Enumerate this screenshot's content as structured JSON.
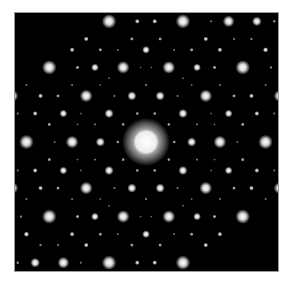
{
  "image": {
    "description": "Electron diffraction pattern with ten-fold (decagonal) quasicrystalline symmetry",
    "background_color": "#ffffff",
    "frame": {
      "x": 15,
      "y": 13,
      "width": 263,
      "height": 258,
      "color": "#000000",
      "edge_color": "#9a9a9a"
    },
    "spot_color": "#ffffff"
  },
  "pattern": {
    "symmetry_order": 10,
    "center": {
      "x": 146,
      "y": 142
    },
    "basis_length_px": 17.8,
    "stretch": {
      "x": 0.98,
      "y": 1.04
    },
    "rotation_deg": 0,
    "index_range": 5,
    "perp_sigma": 0.36,
    "min_intensity": 0.06,
    "central_beam": {
      "radius": 13,
      "glow_radius": 24
    },
    "spot_radius": {
      "min": 0.7,
      "max": 3.6
    },
    "glow_threshold": 0.45
  },
  "observed_bright_spots": [
    {
      "x": 146,
      "y": 48
    },
    {
      "x": 89,
      "y": 66
    },
    {
      "x": 203,
      "y": 66
    },
    {
      "x": 54,
      "y": 113
    },
    {
      "x": 239,
      "y": 113
    },
    {
      "x": 54,
      "y": 172
    },
    {
      "x": 239,
      "y": 172
    },
    {
      "x": 89,
      "y": 218
    },
    {
      "x": 204,
      "y": 218
    },
    {
      "x": 146,
      "y": 236
    }
  ],
  "observed_medium_spots": [
    {
      "x": 111,
      "y": 37
    },
    {
      "x": 182,
      "y": 37
    },
    {
      "x": 54,
      "y": 77
    },
    {
      "x": 239,
      "y": 77
    },
    {
      "x": 32,
      "y": 142
    },
    {
      "x": 261,
      "y": 143
    },
    {
      "x": 54,
      "y": 208
    },
    {
      "x": 239,
      "y": 208
    },
    {
      "x": 111,
      "y": 248
    },
    {
      "x": 182,
      "y": 248
    }
  ]
}
